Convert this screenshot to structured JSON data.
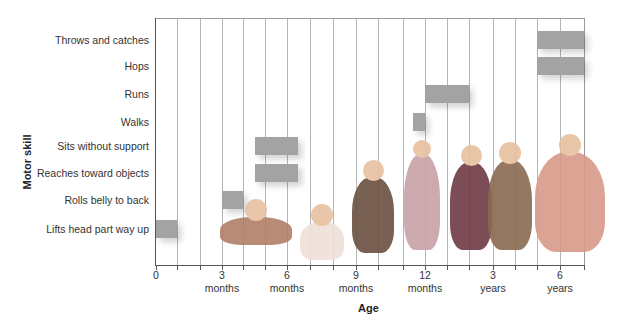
{
  "chart_data": {
    "type": "bar",
    "subtype": "horizontal-range (gantt-style)",
    "title": "",
    "xlabel": "Age",
    "ylabel": "Motor skill",
    "x_ticks": [
      {
        "label": "0",
        "sub": ""
      },
      {
        "label": "3",
        "sub": "months"
      },
      {
        "label": "6",
        "sub": "months"
      },
      {
        "label": "9",
        "sub": "months"
      },
      {
        "label": "12",
        "sub": "months"
      },
      {
        "label": "3",
        "sub": "years"
      },
      {
        "label": "6",
        "sub": "years"
      }
    ],
    "categories": [
      "Throws and catches",
      "Hops",
      "Runs",
      "Walks",
      "Sits without support",
      "Reaches toward objects",
      "Rolls belly to back",
      "Lifts head part way up"
    ],
    "ranges_months": [
      {
        "skill": "Throws and catches",
        "start": "~5 years",
        "end": "~7 years"
      },
      {
        "skill": "Hops",
        "start": "~5 years",
        "end": "~7 years"
      },
      {
        "skill": "Runs",
        "start": 13,
        "end": "~2 years"
      },
      {
        "skill": "Walks",
        "start": 11.5,
        "end": 13
      },
      {
        "skill": "Sits without support",
        "start": 4.5,
        "end": 6.5
      },
      {
        "skill": "Reaches toward objects",
        "start": 4.5,
        "end": 6.5
      },
      {
        "skill": "Rolls belly to back",
        "start": 3,
        "end": 4
      },
      {
        "skill": "Lifts head part way up",
        "start": 0,
        "end": 1
      }
    ],
    "grid": "vertical lines",
    "bar_color": "#a3a3a3"
  },
  "labels": {
    "x_axis_title": "Age",
    "y_axis_title": "Motor skill"
  }
}
